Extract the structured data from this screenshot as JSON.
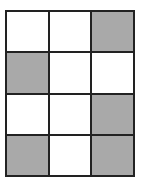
{
  "grid": {
    "rows": 4,
    "cols": 3,
    "colors": {
      "shaded": "#a9a9a9",
      "empty": "#ffffff",
      "border": "#222222"
    },
    "cells": [
      [
        "empty",
        "empty",
        "shaded"
      ],
      [
        "shaded",
        "empty",
        "empty"
      ],
      [
        "empty",
        "empty",
        "shaded"
      ],
      [
        "shaded",
        "empty",
        "shaded"
      ]
    ]
  }
}
